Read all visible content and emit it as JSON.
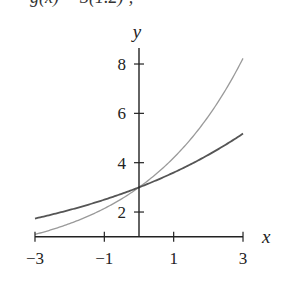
{
  "caption_fragment": "g(x) = 3(1.2)ˣ,",
  "chart_data": {
    "type": "line",
    "title": "",
    "xlabel": "x",
    "ylabel": "y",
    "xlim": [
      -3,
      3
    ],
    "ylim": [
      1,
      8.6
    ],
    "x_ticks": [
      -3,
      -1,
      1,
      3
    ],
    "x_tick_labels": [
      "−3",
      "−1",
      "1",
      "3"
    ],
    "y_ticks": [
      2,
      4,
      6,
      8
    ],
    "y_tick_labels": [
      "2",
      "4",
      "6",
      "8"
    ],
    "grid": false,
    "legend": null,
    "x": [
      -3,
      -2,
      -1,
      0,
      1,
      2,
      3
    ],
    "series": [
      {
        "name": "light curve (≈ 3·1.4^x)",
        "color": "#9a9a9a",
        "values": [
          1.09,
          1.53,
          2.14,
          3.0,
          4.2,
          5.88,
          8.23
        ]
      },
      {
        "name": "dark curve (≈ 3·1.2^x)",
        "color": "#555555",
        "values": [
          1.74,
          2.08,
          2.5,
          3.0,
          3.6,
          4.32,
          5.18
        ]
      }
    ],
    "intersection": {
      "x": 0,
      "y": 3
    }
  },
  "colors": {
    "axis": "#222222",
    "light_curve": "#9a9a9a",
    "dark_curve": "#555555"
  }
}
